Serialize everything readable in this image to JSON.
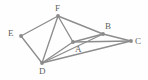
{
  "figure": {
    "background_color": "#fefefe",
    "edge_color": "#8d8d8d",
    "vertex_color": "#8a8a8a",
    "label_color": "#5e5e5e",
    "width": 148,
    "height": 80
  },
  "vertices": [
    {
      "id": "A",
      "label": "A",
      "x": 73,
      "y": 42,
      "label_x": 75,
      "label_y": 45
    },
    {
      "id": "B",
      "label": "B",
      "x": 103,
      "y": 34,
      "label_x": 105,
      "label_y": 22
    },
    {
      "id": "C",
      "label": "C",
      "x": 131,
      "y": 41,
      "label_x": 135,
      "label_y": 37
    },
    {
      "id": "D",
      "label": "D",
      "x": 42,
      "y": 63,
      "label_x": 39,
      "label_y": 67
    },
    {
      "id": "E",
      "label": "E",
      "x": 21,
      "y": 36,
      "label_x": 8,
      "label_y": 29
    },
    {
      "id": "F",
      "label": "F",
      "x": 58,
      "y": 16,
      "label_x": 55,
      "label_y": 4
    }
  ],
  "edges": [
    {
      "id": "EF",
      "from": "E",
      "to": "F"
    },
    {
      "id": "ED",
      "from": "E",
      "to": "D"
    },
    {
      "id": "FD",
      "from": "F",
      "to": "D"
    },
    {
      "id": "FA",
      "from": "F",
      "to": "A"
    },
    {
      "id": "FB",
      "from": "F",
      "to": "B"
    },
    {
      "id": "DA",
      "from": "D",
      "to": "A"
    },
    {
      "id": "DB",
      "from": "D",
      "to": "B"
    },
    {
      "id": "DC",
      "from": "D",
      "to": "C"
    },
    {
      "id": "AB",
      "from": "A",
      "to": "B"
    },
    {
      "id": "AC",
      "from": "A",
      "to": "C"
    },
    {
      "id": "BC",
      "from": "B",
      "to": "C"
    }
  ]
}
